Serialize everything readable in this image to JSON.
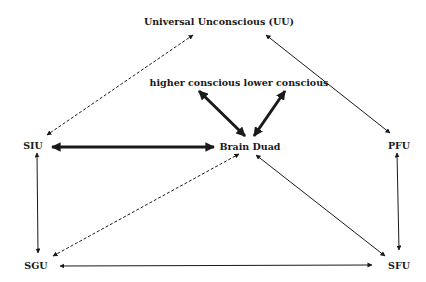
{
  "diagram": {
    "nodes": {
      "uu": "Universal Unconscious (UU)",
      "higher": "higher conscious",
      "lower": "lower conscious",
      "brain": "Brain Duad",
      "siu": "SIU",
      "pfu": "PFU",
      "sgu": "SGU",
      "sfu": "SFU"
    },
    "edges": [
      {
        "from": "UU",
        "to": "SIU",
        "style": "dashed",
        "direction": "bidirectional"
      },
      {
        "from": "UU",
        "to": "PFU",
        "style": "thin",
        "direction": "bidirectional"
      },
      {
        "from": "Brain Duad",
        "to": "higher conscious",
        "style": "thick",
        "direction": "bidirectional"
      },
      {
        "from": "Brain Duad",
        "to": "lower conscious",
        "style": "thick",
        "direction": "bidirectional"
      },
      {
        "from": "SIU",
        "to": "Brain Duad",
        "style": "thick",
        "direction": "bidirectional"
      },
      {
        "from": "SIU",
        "to": "SGU",
        "style": "thin",
        "direction": "bidirectional"
      },
      {
        "from": "PFU",
        "to": "SFU",
        "style": "thin",
        "direction": "bidirectional"
      },
      {
        "from": "SGU",
        "to": "Brain Duad",
        "style": "dashed",
        "direction": "bidirectional"
      },
      {
        "from": "SFU",
        "to": "Brain Duad",
        "style": "thin",
        "direction": "bidirectional"
      },
      {
        "from": "SGU",
        "to": "SFU",
        "style": "thin",
        "direction": "bidirectional"
      }
    ],
    "colors": {
      "line": "#1a1a1a",
      "background": "#ffffff"
    }
  }
}
